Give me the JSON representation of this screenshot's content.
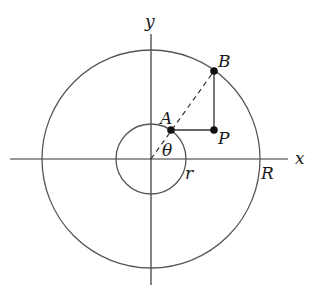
{
  "diagram": {
    "type": "geometry",
    "axes": {
      "x_label": "x",
      "y_label": "y",
      "origin": [
        151,
        159
      ]
    },
    "circles": [
      {
        "name": "outer",
        "radius_label": "R",
        "r_px": 109
      },
      {
        "name": "inner",
        "radius_label": "r",
        "r_px": 35
      }
    ],
    "points": [
      {
        "name": "A",
        "label": "A",
        "x": 171,
        "y": 130
      },
      {
        "name": "B",
        "label": "B",
        "x": 214,
        "y": 71
      },
      {
        "name": "P",
        "label": "P",
        "x": 214,
        "y": 130
      }
    ],
    "angle": {
      "label": "θ"
    },
    "segments": [
      {
        "from": "O",
        "to": "B",
        "style": "dashed"
      },
      {
        "from": "A",
        "to": "P",
        "style": "solid"
      },
      {
        "from": "P",
        "to": "B",
        "style": "solid"
      }
    ],
    "stroke_color": "#333333"
  }
}
